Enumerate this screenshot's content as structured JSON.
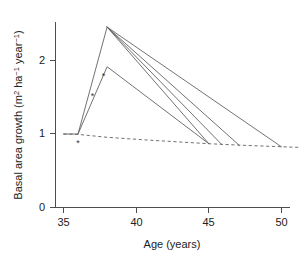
{
  "chart_data": {
    "type": "line",
    "title": "",
    "xlabel": "Age (years)",
    "ylabel": "Basal area growth (m2 ha-1 year-1)",
    "ylabel_parts": {
      "prefix": "Basal area growth (m",
      "sup1": "2",
      "mid": " ha",
      "sup2": "−1",
      "mid2": " year",
      "sup3": "−1",
      "suffix": ")"
    },
    "xlim": [
      34.2,
      51.4
    ],
    "ylim": [
      0,
      2.62
    ],
    "xticks": [
      35,
      40,
      45,
      50
    ],
    "xtick_labels": [
      "35",
      "40",
      "45",
      "50"
    ],
    "yticks": [
      0,
      1,
      2
    ],
    "ytick_labels": [
      "0",
      "1",
      "2"
    ],
    "grid": false,
    "legend": "none",
    "line_color": "#595959",
    "axis_color": "#4d4d4d",
    "series": [
      {
        "name": "baseline-undisturbed",
        "style": "dashed",
        "points": [
          [
            35.0,
            1.0
          ],
          [
            36.0,
            0.995
          ],
          [
            38.0,
            0.955
          ],
          [
            41.0,
            0.915
          ],
          [
            45.0,
            0.868
          ],
          [
            47.5,
            0.845
          ],
          [
            51.2,
            0.818
          ]
        ]
      },
      {
        "name": "thinning-response-rise",
        "style": "solid",
        "points": [
          [
            35.0,
            1.0
          ],
          [
            36.0,
            1.0
          ],
          [
            38.0,
            2.455
          ]
        ]
      },
      {
        "name": "decline-return-age-45",
        "style": "solid",
        "points": [
          [
            38.0,
            2.455
          ],
          [
            45.0,
            0.868
          ]
        ]
      },
      {
        "name": "decline-return-age-46",
        "style": "solid",
        "points": [
          [
            38.0,
            2.455
          ],
          [
            45.9,
            0.855
          ]
        ]
      },
      {
        "name": "decline-return-age-47",
        "style": "solid",
        "points": [
          [
            38.0,
            2.455
          ],
          [
            47.1,
            0.845
          ]
        ]
      },
      {
        "name": "decline-return-age-50",
        "style": "solid",
        "points": [
          [
            38.0,
            2.455
          ],
          [
            50.0,
            0.825
          ]
        ]
      },
      {
        "name": "lower-response-curve",
        "style": "solid",
        "points": [
          [
            36.0,
            1.0
          ],
          [
            38.0,
            1.915
          ],
          [
            45.0,
            0.868
          ]
        ]
      }
    ],
    "data_points": {
      "marker": "*",
      "values": [
        [
          36.0,
          0.885
        ],
        [
          37.0,
          1.525
        ],
        [
          37.75,
          1.79
        ]
      ]
    }
  }
}
